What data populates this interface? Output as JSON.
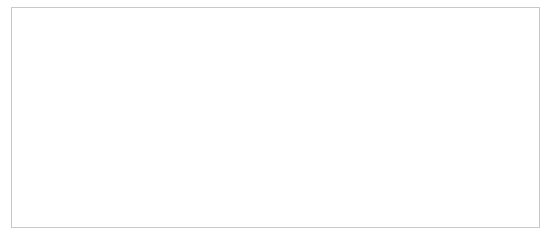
{
  "page": {
    "background_color": "#ffffff",
    "width": 544,
    "height": 247
  },
  "frame": {
    "name": "figure-border",
    "x": 11,
    "y": 7,
    "width": 529,
    "height": 221,
    "stroke_color": "#c9c9c9",
    "stroke_width": 1,
    "fill_color": "#ffffff"
  },
  "figure": {
    "name": "isometric-cube-stack",
    "face_fill_color": "#ffffff",
    "edge_color": "#3a3a3a",
    "edge_width": 1,
    "projection": {
      "type": "isometric",
      "origin_x": 251,
      "origin_y": 160,
      "half_width": 26,
      "half_depth": 15,
      "cube_height": 42
    },
    "layers": [
      {
        "level": 0,
        "label": "bottom layer",
        "cube_count": 5
      },
      {
        "level": 1,
        "label": "middle layer",
        "cube_count": 2
      },
      {
        "level": 2,
        "label": "top layer",
        "cube_count": 1
      }
    ],
    "total_cubes": 8,
    "cubes": [
      {
        "id": "cube-b1",
        "name": "bottom-left-cube",
        "gx": -1,
        "gy": 0,
        "gz": 0
      },
      {
        "id": "cube-b2",
        "name": "bottom-center-cube",
        "gx": 0,
        "gy": 0,
        "gz": 0
      },
      {
        "id": "cube-b3",
        "name": "bottom-right-cube",
        "gx": 0,
        "gy": -1,
        "gz": 0
      },
      {
        "id": "cube-b4",
        "name": "bottom-front-cube",
        "gx": 1,
        "gy": 0,
        "gz": 0
      },
      {
        "id": "cube-b5",
        "name": "bottom-back-cube",
        "gx": 0,
        "gy": 1,
        "gz": 0
      },
      {
        "id": "cube-m1",
        "name": "middle-left-cube",
        "gx": 0,
        "gy": 0,
        "gz": 1
      },
      {
        "id": "cube-m2",
        "name": "middle-right-cube",
        "gx": 0,
        "gy": -1,
        "gz": 1
      },
      {
        "id": "cube-t1",
        "name": "top-cube",
        "gx": 0,
        "gy": 0,
        "gz": 2
      }
    ]
  }
}
